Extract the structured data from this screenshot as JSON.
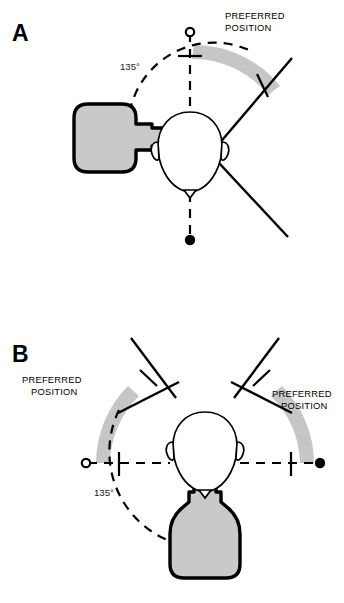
{
  "figure": {
    "background_color": "#ffffff",
    "stroke_color": "#000000",
    "fill_gray": "#c9c9c9",
    "arc_band_gray": "#c6c6c6",
    "caption_text": ""
  },
  "panels": [
    {
      "id": "A",
      "letter": "A",
      "description": "Top view of head with feeding bottle presented from the left side; dashed arc spans 135 degrees from the anterior midline (open circle) to the posterior midline (filled circle).",
      "labels": {
        "preferred_position": "PREFERRED\nPOSITION",
        "preferred_position_line1": "PREFERRED",
        "preferred_position_line2": "POSITION",
        "angle": "135°"
      },
      "markers": {
        "open_circle": "anterior-reference-open-circle",
        "filled_circle": "posterior-reference-filled-circle"
      },
      "elements": {
        "head": "head-top-view",
        "bottle": "feeding-bottle-horizontal",
        "wedge": "preferred-position-wedge",
        "arc_band": "preferred-position-arc-band",
        "dashed_arc": "angle-dashed-arc",
        "dashed_axis": "midline-dashed-axis"
      }
    },
    {
      "id": "B",
      "letter": "B",
      "description": "Top view of head with feeding bottle presented from the front/below; dashed arc spans 135 degrees with two symmetric preferred position wedges, bounded by an open circle on the left and a filled circle on the right.",
      "labels": {
        "preferred_position_left_line1": "PREFERRED",
        "preferred_position_left_line2": "POSITION",
        "preferred_position_right_line1": "PREFERRED",
        "preferred_position_right_line2": "POSITION",
        "angle": "135°"
      },
      "markers": {
        "open_circle": "left-reference-open-circle",
        "filled_circle": "right-reference-filled-circle"
      },
      "elements": {
        "head": "head-top-view",
        "bottle": "feeding-bottle-vertical",
        "wedge_left": "preferred-position-wedge-left",
        "wedge_right": "preferred-position-wedge-right",
        "arc_band_left": "preferred-position-arc-band-left",
        "arc_band_right": "preferred-position-arc-band-right",
        "dashed_arc": "angle-dashed-arc",
        "dashed_axis": "horizontal-dashed-axis"
      }
    }
  ]
}
